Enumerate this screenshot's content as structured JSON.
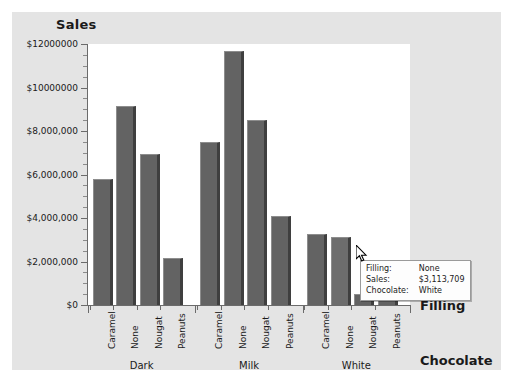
{
  "chart_data": {
    "type": "bar",
    "title": "Sales",
    "xlabel_primary": "Filling",
    "xlabel_secondary": "Chocolate",
    "ylabel": "Sales",
    "ylim": [
      0,
      12000000
    ],
    "grid": false,
    "legend": "none",
    "y_ticks": [
      {
        "value": 0,
        "label": "$0"
      },
      {
        "value": 2000000,
        "label": "$2,000,000"
      },
      {
        "value": 4000000,
        "label": "$4,000,000"
      },
      {
        "value": 6000000,
        "label": "$6,000,000"
      },
      {
        "value": 8000000,
        "label": "$8,000,000"
      },
      {
        "value": 10000000,
        "label": "$10000000"
      },
      {
        "value": 12000000,
        "label": "$12000000"
      }
    ],
    "groups": [
      "Dark",
      "Milk",
      "White"
    ],
    "categories": [
      "Caramel",
      "None",
      "Nougat",
      "Peanuts"
    ],
    "bars": [
      {
        "group": "Dark",
        "category": "Caramel",
        "value": 5800000,
        "highlight": false
      },
      {
        "group": "Dark",
        "category": "None",
        "value": 9150000,
        "highlight": false
      },
      {
        "group": "Dark",
        "category": "Nougat",
        "value": 6950000,
        "highlight": false
      },
      {
        "group": "Dark",
        "category": "Peanuts",
        "value": 2150000,
        "highlight": false
      },
      {
        "group": "Milk",
        "category": "Caramel",
        "value": 7500000,
        "highlight": false
      },
      {
        "group": "Milk",
        "category": "None",
        "value": 11700000,
        "highlight": false
      },
      {
        "group": "Milk",
        "category": "Nougat",
        "value": 8500000,
        "highlight": false
      },
      {
        "group": "Milk",
        "category": "Peanuts",
        "value": 4100000,
        "highlight": false
      },
      {
        "group": "White",
        "category": "Caramel",
        "value": 3250000,
        "highlight": false
      },
      {
        "group": "White",
        "category": "None",
        "value": 3113709,
        "highlight": true
      },
      {
        "group": "White",
        "category": "Nougat",
        "value": 500000,
        "highlight": false
      },
      {
        "group": "White",
        "category": "Peanuts",
        "value": 430000,
        "highlight": false
      }
    ],
    "colors": {
      "bar": "#636363",
      "bar_highlight": "#6d6d6d",
      "bar_side": "#3f3f3f",
      "plot_background": "#ffffff",
      "panel_background": "#e4e4e4",
      "axis": "#6b6b6b",
      "text": "#1a1a1a"
    }
  },
  "tooltip": {
    "rows": [
      {
        "key": "Filling:",
        "value": "None"
      },
      {
        "key": "Sales:",
        "value": "$3,113,709"
      },
      {
        "key": "Chocolate:",
        "value": "White"
      }
    ]
  },
  "cursor": {
    "icon": "mouse-pointer-icon"
  }
}
